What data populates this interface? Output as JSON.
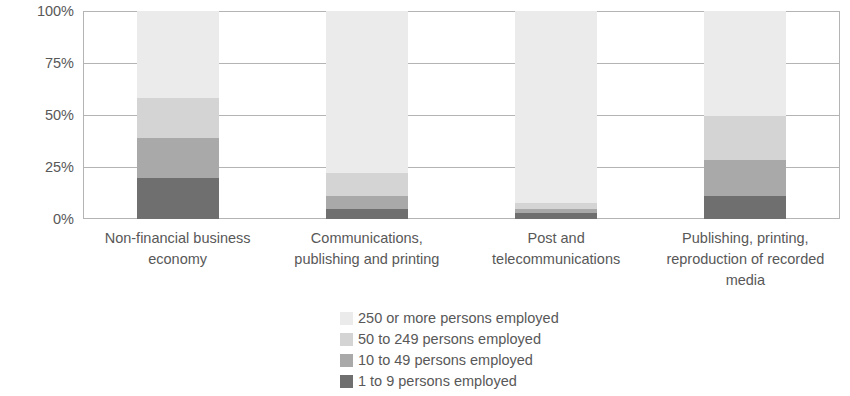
{
  "chart_data": {
    "type": "bar",
    "subtype": "stacked-percentage",
    "title": "",
    "subtitle": "",
    "xlabel": "",
    "ylabel": "",
    "ylim": [
      0,
      100
    ],
    "yticks": [
      "0%",
      "25%",
      "50%",
      "75%",
      "100%"
    ],
    "ytick_values": [
      0,
      25,
      50,
      75,
      100
    ],
    "grid": true,
    "legend_position": "bottom-center",
    "categories": [
      "Non-financial business economy",
      "Communications, publishing and printing",
      "Post and telecommunications",
      "Publishing, printing, reproduction of recorded media"
    ],
    "category_lines": [
      [
        "Non-financial business",
        "economy"
      ],
      [
        "Communications,",
        "publishing and printing"
      ],
      [
        "Post and",
        "telecommunications"
      ],
      [
        "Publishing, printing,",
        "reproduction of recorded",
        "media"
      ]
    ],
    "series": [
      {
        "name": "250 or more persons employed",
        "color": "#ebebeb",
        "values": [
          42.0,
          78.0,
          92.5,
          60.5
        ]
      },
      {
        "name": "50 to 249 persons employed",
        "color": "#d4d4d4",
        "values": [
          19.0,
          11.0,
          2.5,
          25.5
        ]
      },
      {
        "name": "10 to 49 persons employed",
        "color": "#a9a9a9",
        "values": [
          19.5,
          6.0,
          2.0,
          21.0
        ]
      },
      {
        "name": "1 to 9 persons employed",
        "color": "#6f6f6f",
        "values": [
          19.5,
          5.0,
          3.0,
          13.0
        ]
      }
    ]
  },
  "axis": {
    "y_tick_labels": [
      "100%",
      "75%",
      "50%",
      "25%",
      "0%"
    ]
  },
  "legend": {
    "items": [
      {
        "label": "250 or more persons employed",
        "color": "#ebebeb"
      },
      {
        "label": "50 to 249 persons employed",
        "color": "#d4d4d4"
      },
      {
        "label": "10 to 49 persons employed",
        "color": "#a9a9a9"
      },
      {
        "label": "1 to 9 persons employed",
        "color": "#6f6f6f"
      }
    ]
  },
  "colors": {
    "grid": "#b4b4b4",
    "text": "#585858",
    "background": "#ffffff"
  }
}
